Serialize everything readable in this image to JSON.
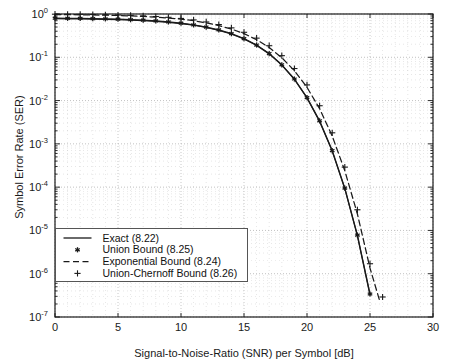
{
  "chart_data": {
    "type": "line",
    "title": "",
    "xlabel": "Signal-to-Noise-Ratio (SNR) per Symbol [dB]",
    "ylabel": "Symbol Error Rate (SER)",
    "xlim": [
      0,
      30
    ],
    "ylim": [
      1e-07,
      1
    ],
    "yscale": "log",
    "xscale": "linear",
    "grid": true,
    "grid_style": "dotted",
    "grid_minor": true,
    "legend_position": "lower-left",
    "xticks": [
      0,
      5,
      10,
      15,
      20,
      25,
      30
    ],
    "xticklabels": [
      "0",
      "5",
      "10",
      "15",
      "20",
      "25",
      "30"
    ],
    "yticks": [
      1,
      0.1,
      0.01,
      0.001,
      0.0001,
      1e-05,
      1e-06,
      1e-07
    ],
    "yticklabels": [
      "10^0",
      "10^-1",
      "10^-2",
      "10^-3",
      "10^-4",
      "10^-5",
      "10^-6",
      "10^-7"
    ],
    "series": [
      {
        "name": "Exact (8.22)",
        "key": "exact",
        "style": "solid",
        "marker": "none",
        "color": "#1a1a1a",
        "x": [
          0,
          1,
          2,
          3,
          4,
          5,
          6,
          7,
          8,
          9,
          10,
          11,
          12,
          13,
          14,
          15,
          16,
          17,
          18,
          19,
          20,
          21,
          22,
          23,
          24,
          25,
          25.5,
          26
        ],
        "y": [
          0.78,
          0.775,
          0.77,
          0.762,
          0.752,
          0.74,
          0.723,
          0.702,
          0.675,
          0.642,
          0.6,
          0.55,
          0.49,
          0.42,
          0.345,
          0.265,
          0.188,
          0.12,
          0.066,
          0.031,
          0.0115,
          0.0033,
          0.00068,
          9.2e-05,
          7.5e-06,
          3.2e-07,
          9e-08,
          2e-08
        ]
      },
      {
        "name": "Union Bound (8.25)",
        "key": "union",
        "style": "solid",
        "marker": "asterisk",
        "color": "#1a1a1a",
        "x": [
          0,
          1,
          2,
          3,
          4,
          5,
          6,
          7,
          8,
          9,
          10,
          11,
          12,
          13,
          14,
          15,
          16,
          17,
          18,
          19,
          20,
          21,
          22,
          23,
          24,
          25
        ],
        "y": [
          0.8,
          0.795,
          0.79,
          0.782,
          0.772,
          0.758,
          0.74,
          0.718,
          0.69,
          0.655,
          0.612,
          0.56,
          0.5,
          0.43,
          0.352,
          0.27,
          0.192,
          0.122,
          0.067,
          0.0315,
          0.0117,
          0.0034,
          0.0007,
          9.5e-05,
          7.8e-06,
          3.4e-07
        ]
      },
      {
        "name": "Exponential Bound (8.24)",
        "key": "exponential",
        "style": "dashed",
        "marker": "none",
        "color": "#1a1a1a",
        "x": [
          0,
          1,
          2,
          3,
          4,
          5,
          6,
          7,
          8,
          9,
          10,
          11,
          12,
          13,
          14,
          15,
          16,
          17,
          18,
          19,
          20,
          21,
          22,
          23,
          24,
          25,
          25.8,
          26.3
        ],
        "y": [
          0.97,
          0.965,
          0.958,
          0.95,
          0.94,
          0.925,
          0.905,
          0.88,
          0.848,
          0.81,
          0.762,
          0.7,
          0.625,
          0.54,
          0.45,
          0.352,
          0.255,
          0.168,
          0.098,
          0.049,
          0.0202,
          0.0065,
          0.00152,
          0.00024,
          2.4e-05,
          1.35e-06,
          2.2e-07,
          6e-08
        ]
      },
      {
        "name": "Union-Chernoff Bound (8.26)",
        "key": "union_chernoff",
        "style": "none",
        "marker": "plus",
        "color": "#1a1a1a",
        "x": [
          0,
          1,
          2,
          3,
          4,
          5,
          6,
          7,
          8,
          9,
          10,
          11,
          12,
          13,
          14,
          15,
          16,
          17,
          18,
          19,
          20,
          21,
          22,
          23,
          24,
          25,
          26
        ],
        "y": [
          0.99,
          0.985,
          0.98,
          0.972,
          0.962,
          0.948,
          0.93,
          0.905,
          0.875,
          0.838,
          0.79,
          0.73,
          0.655,
          0.57,
          0.478,
          0.378,
          0.277,
          0.185,
          0.109,
          0.055,
          0.023,
          0.0076,
          0.0018,
          0.00029,
          3e-05,
          1.7e-06,
          2.9e-07
        ]
      }
    ]
  },
  "legend": {
    "items": [
      {
        "label": "Exact (8.22)",
        "symbol": "line-solid"
      },
      {
        "label": "Union Bound (8.25)",
        "symbol": "marker-asterisk"
      },
      {
        "label": "Exponential Bound (8.24)",
        "symbol": "line-dashed"
      },
      {
        "label": "Union-Chernoff Bound (8.26)",
        "symbol": "marker-plus"
      }
    ]
  },
  "colors": {
    "axis": "#1a1a1a",
    "grid": "#b8b8b8",
    "curve": "#1a1a1a",
    "background": "#ffffff",
    "legend_border": "#555555"
  }
}
